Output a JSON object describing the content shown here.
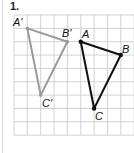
{
  "problem": {
    "number": "1."
  },
  "grid": {
    "x0": 14,
    "y0": 15,
    "cell": 13.35,
    "cols": 9,
    "rows": 9,
    "line_color": "#c8c8c8"
  },
  "figures": {
    "image": {
      "color": "#9a9a9a",
      "vertices": [
        {
          "label": "A'",
          "gx": 1,
          "gy": 1
        },
        {
          "label": "B'",
          "gx": 4,
          "gy": 2
        },
        {
          "label": "C'",
          "gx": 2,
          "gy": 6
        }
      ]
    },
    "preimage": {
      "color": "#111111",
      "vertices": [
        {
          "label": "A",
          "gx": 5,
          "gy": 2
        },
        {
          "label": "B",
          "gx": 8,
          "gy": 3
        },
        {
          "label": "C",
          "gx": 6,
          "gy": 7
        }
      ]
    }
  },
  "labels": {
    "a_prime": "A'",
    "b_prime": "B'",
    "c_prime": "C'",
    "a": "A",
    "b": "B",
    "c": "C"
  }
}
